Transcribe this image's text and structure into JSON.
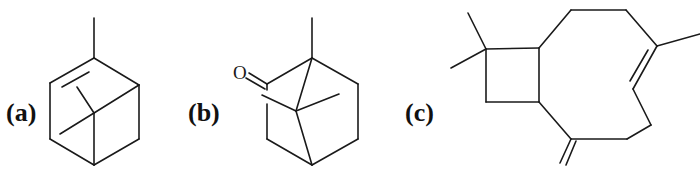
{
  "figure": {
    "panels": [
      {
        "id": "a",
        "label": "(a)",
        "molecule": "alpha-pinene",
        "atoms": []
      },
      {
        "id": "b",
        "label": "(b)",
        "molecule": "camphor",
        "atoms": [
          {
            "symbol": "O"
          }
        ]
      },
      {
        "id": "c",
        "label": "(c)",
        "molecule": "beta-caryophyllene",
        "atoms": []
      }
    ],
    "colors": {
      "line": "#1a1a1a",
      "background": "#ffffff"
    }
  }
}
